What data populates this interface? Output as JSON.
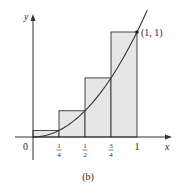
{
  "chart_data": {
    "type": "area",
    "title": "",
    "caption": "(b)",
    "xlabel": "x",
    "ylabel": "y",
    "origin_label": "0",
    "curve": "y = x^2",
    "xlim": [
      0,
      1.2
    ],
    "ylim": [
      0,
      1.1
    ],
    "x_ticks": [
      {
        "value": 0.25,
        "num": "1",
        "den": "4"
      },
      {
        "value": 0.5,
        "num": "1",
        "den": "2"
      },
      {
        "value": 0.75,
        "num": "3",
        "den": "4"
      },
      {
        "value": 1,
        "label": "1"
      }
    ],
    "rectangles": [
      {
        "x0": 0,
        "x1": 0.25,
        "height": 0.0625
      },
      {
        "x0": 0.25,
        "x1": 0.5,
        "height": 0.25
      },
      {
        "x0": 0.5,
        "x1": 0.75,
        "height": 0.5625
      },
      {
        "x0": 0.75,
        "x1": 1,
        "height": 1
      }
    ],
    "annotations": [
      {
        "x": 1,
        "y": 1,
        "label": "(1, 1)"
      }
    ],
    "colors": {
      "fill": "#e6e6e6",
      "stroke": "#333333"
    }
  }
}
